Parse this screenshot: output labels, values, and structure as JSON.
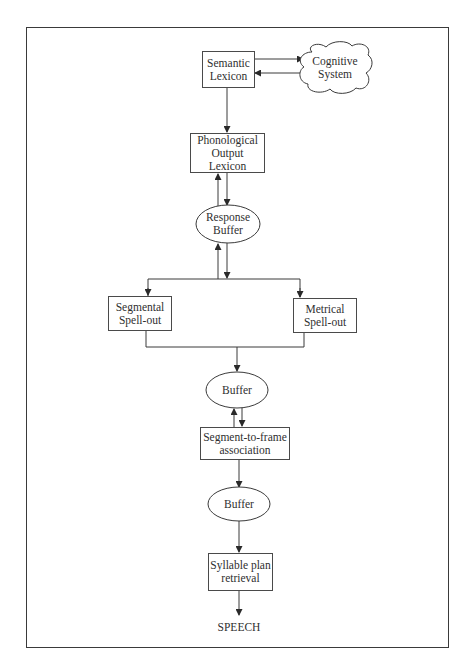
{
  "diagram": {
    "nodes": {
      "semantic_lexicon": {
        "label": "Semantic\nLexicon",
        "shape": "rectangle"
      },
      "cognitive_system": {
        "label": "Cognitive\nSystem",
        "shape": "cloud"
      },
      "phonological_output_lexicon": {
        "label": "Phonological\nOutput\nLexicon",
        "shape": "rectangle"
      },
      "response_buffer": {
        "label": "Response\nBuffer",
        "shape": "ellipse"
      },
      "segmental_spell_out": {
        "label": "Segmental\nSpell-out",
        "shape": "rectangle"
      },
      "metrical_spell_out": {
        "label": "Metrical\nSpell-out",
        "shape": "rectangle"
      },
      "buffer_1": {
        "label": "Buffer",
        "shape": "ellipse"
      },
      "segment_to_frame": {
        "label": "Segment-to-frame\nassociation",
        "shape": "rectangle"
      },
      "buffer_2": {
        "label": "Buffer",
        "shape": "ellipse"
      },
      "syllable_plan_retrieval": {
        "label": "Syllable plan\nretrieval",
        "shape": "rectangle"
      },
      "speech": {
        "label": "SPEECH",
        "shape": "text"
      }
    },
    "edges": [
      {
        "from": "semantic_lexicon",
        "to": "cognitive_system"
      },
      {
        "from": "cognitive_system",
        "to": "semantic_lexicon"
      },
      {
        "from": "semantic_lexicon",
        "to": "phonological_output_lexicon"
      },
      {
        "from": "phonological_output_lexicon",
        "to": "response_buffer"
      },
      {
        "from": "response_buffer",
        "to": "phonological_output_lexicon"
      },
      {
        "from": "response_buffer",
        "to": "segmental_spell_out"
      },
      {
        "from": "response_buffer",
        "to": "metrical_spell_out"
      },
      {
        "from": "segmental_spell_out",
        "to": "response_buffer"
      },
      {
        "from": "segmental_spell_out",
        "to": "buffer_1"
      },
      {
        "from": "metrical_spell_out",
        "to": "buffer_1"
      },
      {
        "from": "buffer_1",
        "to": "segment_to_frame"
      },
      {
        "from": "segment_to_frame",
        "to": "buffer_1"
      },
      {
        "from": "segment_to_frame",
        "to": "buffer_2"
      },
      {
        "from": "buffer_2",
        "to": "syllable_plan_retrieval"
      },
      {
        "from": "syllable_plan_retrieval",
        "to": "speech"
      }
    ],
    "colors": {
      "stroke": "#3a3a3a",
      "text": "#2f2f2f",
      "background": "#ffffff"
    }
  }
}
